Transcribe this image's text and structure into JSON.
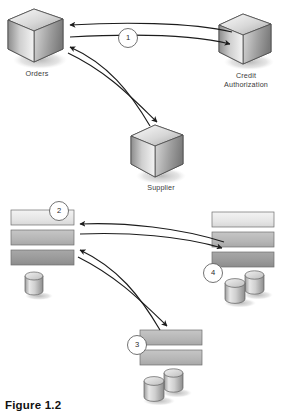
{
  "figure": {
    "caption": "Figure 1.2",
    "background_color": "#ffffff"
  },
  "palette": {
    "cube_light": "#f2f2f2",
    "cube_mid": "#b9b9b9",
    "cube_dark": "#7d7d7d",
    "bar_light": "#e9e9e9",
    "bar_mid": "#b7b7b7",
    "bar_dark": "#9b9b9b",
    "cylinder_light": "#e3e3e3",
    "cylinder_dark": "#8e8e8e",
    "outline": "#4a4a4a",
    "arrow": "#1c1c1c",
    "shadow": "#c9c9c9",
    "label_text": "#3a3a3a",
    "caption_text": "#111111"
  },
  "top_section": {
    "nodes": [
      {
        "id": "orders",
        "label": "Orders",
        "shape": "cube"
      },
      {
        "id": "credit-authorization",
        "label": "Credit\nAuthorization",
        "shape": "cube"
      },
      {
        "id": "supplier",
        "label": "Supplier",
        "shape": "cube"
      }
    ],
    "step_markers": [
      {
        "id": "marker-1",
        "value": "1"
      }
    ],
    "flows": [
      {
        "from": "credit-authorization",
        "to": "orders",
        "direction": "left"
      },
      {
        "from": "orders",
        "to": "credit-authorization",
        "direction": "right"
      },
      {
        "from": "supplier",
        "to": "orders",
        "direction": "left"
      },
      {
        "from": "orders",
        "to": "supplier",
        "direction": "down"
      }
    ]
  },
  "bottom_section": {
    "nodes": [
      {
        "id": "left-stack",
        "bars": 3,
        "cylinders": 1
      },
      {
        "id": "right-stack",
        "bars": 3,
        "cylinders": 2
      },
      {
        "id": "center-stack",
        "bars": 2,
        "cylinders": 2
      }
    ],
    "step_markers": [
      {
        "id": "marker-2",
        "value": "2"
      },
      {
        "id": "marker-3",
        "value": "3"
      },
      {
        "id": "marker-4",
        "value": "4"
      }
    ],
    "flows": [
      {
        "from": "right-stack",
        "to": "left-stack",
        "direction": "left"
      },
      {
        "from": "left-stack",
        "to": "right-stack",
        "direction": "right"
      },
      {
        "from": "center-stack",
        "to": "left-stack",
        "direction": "left"
      },
      {
        "from": "left-stack",
        "to": "center-stack",
        "direction": "down"
      }
    ]
  }
}
